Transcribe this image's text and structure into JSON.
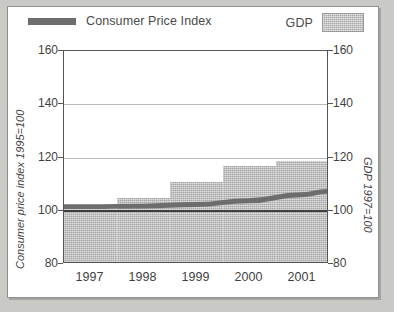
{
  "legend": {
    "cpi_label": "Consumer Price Index",
    "gdp_label": "GDP",
    "cpi_swatch_icon": "thick-line-swatch",
    "gdp_swatch_icon": "hatched-box-swatch"
  },
  "axes": {
    "left_title": "Consumer price index 1995=100",
    "right_title": "GDP 1997=100",
    "ticks": [
      "160",
      "140",
      "120",
      "100",
      "80"
    ]
  },
  "chart_data": {
    "type": "bar",
    "title": "",
    "subtitle": "",
    "xlabel": "",
    "ylabel": "Consumer price index 1995=100",
    "y2label": "GDP 1997=100",
    "categories": [
      "1997",
      "1998",
      "1999",
      "2000",
      "2001"
    ],
    "ylim": [
      80,
      160
    ],
    "y2lim": [
      80,
      160
    ],
    "yticks": [
      80,
      100,
      120,
      140,
      160
    ],
    "y2ticks": [
      80,
      100,
      120,
      140,
      160
    ],
    "grid": true,
    "gridlines_at": [
      120,
      140
    ],
    "baseline": 100,
    "legend_position": "top",
    "series": [
      {
        "name": "GDP",
        "type": "bar",
        "axis": "right",
        "color": "#a6a6a6",
        "values": [
          100,
          104,
          110,
          116,
          118
        ]
      },
      {
        "name": "Consumer Price Index",
        "type": "line",
        "axis": "left",
        "color": "#6d6d6d",
        "values": [
          101,
          101.2,
          101.8,
          103.2,
          105.5
        ]
      }
    ]
  }
}
